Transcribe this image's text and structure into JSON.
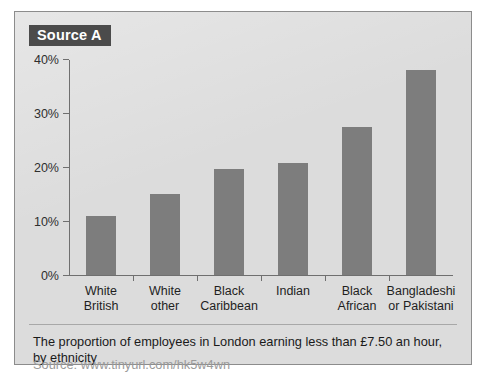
{
  "panel": {
    "badge_label": "Source A",
    "background_color": "#dcdcdc",
    "border_color": "#8c8c8c",
    "badge_background": "#4b4b4b",
    "badge_text_color": "#ffffff"
  },
  "caption": {
    "text": "The proportion of employees in London earning less than £7.50 an hour, by ethnicity",
    "source": "Source: www.tinyurl.com/hk5w4wn"
  },
  "chart_data": {
    "type": "bar",
    "title": "The proportion of employees in London earning less than £7.50 an hour, by ethnicity",
    "categories": [
      "White British",
      "White other",
      "Black Caribbean",
      "Indian",
      "Black African",
      "Bangladeshi or Pakistani"
    ],
    "category_lines": [
      [
        "White",
        "British"
      ],
      [
        "White",
        "other"
      ],
      [
        "Black",
        "Caribbean"
      ],
      [
        "Indian"
      ],
      [
        "Black",
        "African"
      ],
      [
        "Bangladeshi",
        "or Pakistani"
      ]
    ],
    "values": [
      11.0,
      15.0,
      19.7,
      20.7,
      27.5,
      38.0
    ],
    "xlabel": "",
    "ylabel": "",
    "ylim": [
      0,
      40
    ],
    "yticks": [
      0,
      10,
      20,
      30,
      40
    ],
    "ytick_labels": [
      "0%",
      "10%",
      "20%",
      "30%",
      "40%"
    ],
    "grid": false,
    "legend": "none",
    "bar_color": "#7d7d7d",
    "axis_color": "#6f6f6f"
  }
}
